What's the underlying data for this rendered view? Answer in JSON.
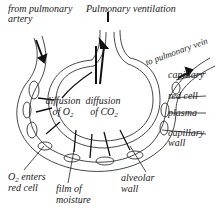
{
  "diagram": {
    "labels": {
      "from_pulmonary_artery_line1": "from pulmonary",
      "from_pulmonary_artery_line2": "artery",
      "pulmonary_ventilation": "Pulmonary ventilation",
      "to_pulmonary_vein": "to pulmonary vein",
      "capillary": "capillary",
      "red_cell": "red cell",
      "plasma": "plasma",
      "capillary_wall_line1": "capillary",
      "capillary_wall_line2": "wall",
      "diffusion_o2_line1": "diffusion",
      "diffusion_o2_line2_prefix": "of O",
      "diffusion_o2_sub": "2",
      "diffusion_co2_line1": "diffusion",
      "diffusion_co2_line2_prefix": "of CO",
      "diffusion_co2_sub": "2",
      "o2_enters_line1_prefix": "O",
      "o2_enters_sub": "2",
      "o2_enters_line1_suffix": " enters",
      "o2_enters_line2": "red cell",
      "film_of_moisture_line1": "film of",
      "film_of_moisture_line2": "moisture",
      "alveolar_wall_line1": "alveolar",
      "alveolar_wall_line2": "wall"
    },
    "colors": {
      "line": "#222222",
      "background": "#ffffff"
    }
  }
}
